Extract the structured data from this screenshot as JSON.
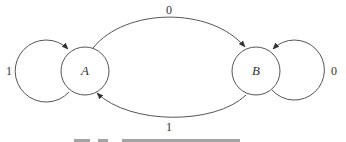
{
  "diagram": {
    "type": "state-machine",
    "colors": {
      "stroke": "#555555",
      "text": "#333333",
      "background": "#ffffff"
    },
    "states": [
      {
        "id": "A",
        "label": "A"
      },
      {
        "id": "B",
        "label": "B"
      }
    ],
    "transitions": [
      {
        "from": "A",
        "to": "A",
        "label": "1"
      },
      {
        "from": "A",
        "to": "B",
        "label": "0"
      },
      {
        "from": "B",
        "to": "B",
        "label": "0"
      },
      {
        "from": "B",
        "to": "A",
        "label": "1"
      }
    ]
  }
}
